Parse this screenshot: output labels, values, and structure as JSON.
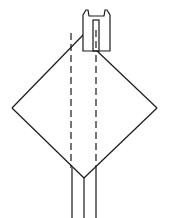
{
  "diagram": {
    "title": "",
    "colors": {
      "stroke": "#1a1a1a",
      "background": "#ffffff"
    },
    "elements": {
      "diamond": {
        "left": [
          12,
          108
        ],
        "right": [
          157,
          108
        ],
        "bottom": [
          84,
          178
        ],
        "top_left_end": [
          84,
          34
        ],
        "top_right_start": [
          96,
          50
        ]
      },
      "connector": {
        "x": 83,
        "y": 10,
        "width": 27,
        "height": 41
      },
      "connector_slot": {
        "x": 93,
        "y": 20,
        "width": 6,
        "height": 31
      },
      "dashed_lines": [
        {
          "x": 71,
          "y1": 33,
          "y2": 168
        },
        {
          "x": 96,
          "y1": 33,
          "y2": 168
        }
      ],
      "bottom_lines": [
        {
          "x": 72,
          "y1": 168,
          "y2": 218
        },
        {
          "x": 84,
          "y1": 178,
          "y2": 218
        },
        {
          "x": 96,
          "y1": 168,
          "y2": 218
        }
      ]
    }
  }
}
